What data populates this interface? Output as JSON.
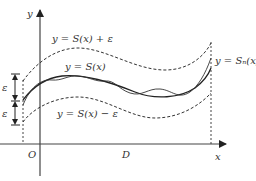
{
  "diagram": {
    "type": "function-approximation-band",
    "axes": {
      "x_label": "x",
      "y_label": "y",
      "origin_label": "O",
      "domain_label": "D"
    },
    "curves": [
      {
        "id": "upper-bound",
        "label": "y = S(x) + ε",
        "style": "dashed"
      },
      {
        "id": "target-function",
        "label": "y = S(x)",
        "style": "solid"
      },
      {
        "id": "lower-bound",
        "label": "y = S(x) − ε",
        "style": "dashed"
      },
      {
        "id": "approximation",
        "label": "y = Sₙ(x)",
        "style": "solid"
      }
    ],
    "epsilon_markers": [
      "ε",
      "ε"
    ],
    "colors": {
      "line": "#333333",
      "background": "#ffffff"
    }
  },
  "labels": {
    "upper": "y = S(x) + ε",
    "middle": "y = S(x)",
    "lower": "y = S(x) − ε",
    "approx": "y = Sₙ(x)",
    "eps_top": "ε",
    "eps_bottom": "ε",
    "x_axis": "x",
    "y_axis": "y",
    "origin": "O",
    "domain": "D"
  }
}
